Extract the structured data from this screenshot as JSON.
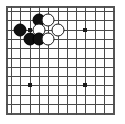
{
  "board": {
    "title": "Go board diagram",
    "columns": 11,
    "rows": 11,
    "cell_size": 9.3,
    "origin_x": 5,
    "origin_y": 5,
    "line_color": "#4a4a4a",
    "frame_color": "#555555",
    "background_color": "#ffffff",
    "black_color": "#101010",
    "white_color": "#ffffff"
  },
  "star_points": [
    {
      "name": "star-point-top-left",
      "col": 2,
      "row": 2
    },
    {
      "name": "star-point-top-right",
      "col": 8,
      "row": 2
    },
    {
      "name": "star-point-bottom-left",
      "col": 2,
      "row": 8
    },
    {
      "name": "star-point-bottom-right",
      "col": 8,
      "row": 8
    }
  ],
  "stones": [
    {
      "name": "black-stone-1",
      "color": "black",
      "col": 3,
      "row": 1
    },
    {
      "name": "white-stone-1",
      "color": "white",
      "col": 4,
      "row": 1
    },
    {
      "name": "black-stone-2",
      "color": "black",
      "col": 1,
      "row": 2
    },
    {
      "name": "white-stone-2",
      "color": "white",
      "col": 3,
      "row": 2
    },
    {
      "name": "white-stone-3",
      "color": "white",
      "col": 5,
      "row": 2
    },
    {
      "name": "black-stone-3",
      "color": "black",
      "col": 2,
      "row": 3
    },
    {
      "name": "black-stone-4",
      "color": "black",
      "col": 3,
      "row": 3
    },
    {
      "name": "white-stone-4",
      "color": "white",
      "col": 4,
      "row": 3
    }
  ]
}
